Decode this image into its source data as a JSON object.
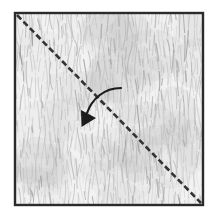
{
  "figure": {
    "caption": "",
    "background_color": "#ffffff"
  },
  "panel": {
    "name": "textured-square",
    "x": 15,
    "y": 13,
    "width": 188,
    "height": 192,
    "border_color": "#2b2b2b",
    "border_width": 2.4,
    "fill_color": "#f2f2f2",
    "texture": {
      "kind": "fingerprint-striation",
      "description": "dense fine wavy near-vertical striations",
      "line_color": "#b4b4b4",
      "line_color_dark": "#9a9a9a",
      "line_width": 0.7,
      "spacing": 3.0,
      "wave_amplitude": 1.6,
      "wave_period": 11
    }
  },
  "dashed_line": {
    "name": "diagonal-dashed-line",
    "label": "",
    "x1": 17,
    "y1": 15,
    "x2": 201,
    "y2": 203,
    "color": "#333333",
    "width": 2.6,
    "dash": "6 3.2",
    "orientation": "top-left to bottom-right diagonal"
  },
  "arrow": {
    "name": "curved-direction-arrow",
    "label": "",
    "color": "#1c1c1c",
    "width": 2.2,
    "path": "M121,88 C104,88 92,99 87,113",
    "head": {
      "points": "81.5,127 81,110 96,118",
      "angle_deg": 225
    },
    "meaning": "curved arrow crossing the dashed line pointing down-left"
  },
  "colors": {
    "ink": "#2b2b2b",
    "texture_light": "#d8d8d8",
    "texture_mid": "#b4b4b4",
    "texture_dark": "#9a9a9a",
    "paper": "#f2f2f2",
    "page": "#ffffff"
  }
}
